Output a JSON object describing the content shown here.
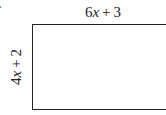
{
  "problem": {
    "number_fragment": "."
  },
  "rectangle": {
    "top_label": {
      "coefficient": "6",
      "variable": "x",
      "operator": "+",
      "constant": "3",
      "full": "6x + 3"
    },
    "side_label": {
      "coefficient": "4",
      "variable": "x",
      "operator": "+",
      "constant": "2",
      "full": "4x + 2"
    },
    "stroke_color": "#222222",
    "fill_color": "#ffffff"
  }
}
